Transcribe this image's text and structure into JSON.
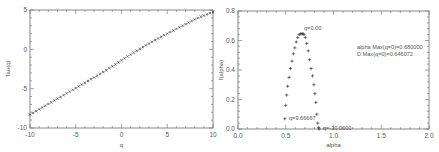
{
  "chart_data": [
    {
      "type": "scatter",
      "title": "",
      "xlabel": "q",
      "ylabel": "Tau(q)",
      "xlim": [
        -10,
        10
      ],
      "ylim": [
        -10,
        5
      ],
      "xticks": [
        "-10",
        "-5",
        "0",
        "5",
        "10"
      ],
      "yticks": [
        "-10",
        "-5",
        "0",
        "5"
      ],
      "marker": "x",
      "x": [
        -10,
        -9.333,
        -8.667,
        -8,
        -7.333,
        -6.667,
        -6,
        -5.333,
        -4.667,
        -4,
        -3.333,
        -2.667,
        -2,
        -1.333,
        -0.667,
        0,
        0.667,
        1.333,
        2,
        2.667,
        3.333,
        4,
        4.667,
        5.333,
        6,
        6.667,
        7.333,
        8,
        8.667,
        9.333,
        10
      ],
      "y": [
        -8.3,
        -7.85,
        -7.4,
        -6.95,
        -6.5,
        -6.05,
        -5.6,
        -5.15,
        -4.7,
        -4.25,
        -3.8,
        -3.35,
        -2.9,
        -2.4,
        -1.9,
        -1.4,
        -0.9,
        -0.42,
        0.05,
        0.5,
        0.95,
        1.38,
        1.8,
        2.2,
        2.6,
        3.0,
        3.4,
        3.8,
        4.15,
        4.45,
        4.75
      ],
      "grid": false
    },
    {
      "type": "scatter",
      "title": "",
      "xlabel": "alpha",
      "ylabel": "f(alpha)",
      "xlim": [
        0,
        2
      ],
      "ylim": [
        0,
        0.8
      ],
      "xticks": [
        "0.0",
        "0.5",
        "1.0",
        "1.5",
        "2.0"
      ],
      "yticks": [
        "0.0",
        "0.2",
        "0.4",
        "0.6",
        "0.8"
      ],
      "marker": "+",
      "x": [
        0.49,
        0.5,
        0.51,
        0.52,
        0.535,
        0.55,
        0.565,
        0.58,
        0.595,
        0.61,
        0.625,
        0.64,
        0.655,
        0.67,
        0.68,
        0.69,
        0.705,
        0.72,
        0.735,
        0.75,
        0.765,
        0.78,
        0.795,
        0.805,
        0.815,
        0.825,
        0.835,
        0.845,
        0.85
      ],
      "y": [
        0.07,
        0.16,
        0.23,
        0.29,
        0.35,
        0.41,
        0.46,
        0.51,
        0.55,
        0.59,
        0.62,
        0.64,
        0.645,
        0.646,
        0.646,
        0.64,
        0.62,
        0.58,
        0.53,
        0.47,
        0.41,
        0.36,
        0.3,
        0.24,
        0.18,
        0.1,
        0.04,
        0.01,
        0.0
      ],
      "annotations": [
        {
          "text": "q=0.00",
          "x": 0.66,
          "y": 0.67
        },
        {
          "text": "q=9.66667",
          "x": 0.5,
          "y": 0.07
        },
        {
          "text": "q=-10.0000",
          "x": 0.86,
          "y": 0.0
        },
        {
          "text": "alpha Max(q=0)=0.680000",
          "x": 1.3,
          "y": 0.56
        },
        {
          "text": "D Max(q=0)=0.646072",
          "x": 1.3,
          "y": 0.52
        }
      ],
      "grid": false
    }
  ],
  "left_plot": {
    "xlabel": "q",
    "ylabel": "Tau(q)",
    "xticks": [
      "-10",
      "-5",
      "0",
      "5",
      "10"
    ],
    "yticks": [
      "-10",
      "-5",
      "0",
      "5"
    ]
  },
  "right_plot": {
    "xlabel": "alpha",
    "ylabel": "f(alpha)",
    "xticks": [
      "0.0",
      "0.5",
      "1.0",
      "1.5",
      "2.0"
    ],
    "yticks": [
      "0.0",
      "0.2",
      "0.4",
      "0.6",
      "0.8"
    ],
    "annot_peak": "q=0.00",
    "annot_left": "q=9.66667",
    "annot_bottom": "q=-10.0000",
    "annot_alpha_max": "alpha Max(q=0)=0.680000",
    "annot_d_max": "D Max(q=0)=0.646072"
  }
}
